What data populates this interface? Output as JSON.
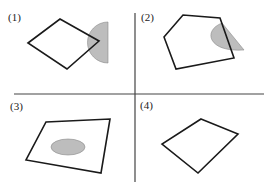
{
  "figure": {
    "colors": {
      "outline": "#1a1a1a",
      "shaded_region": "#bdbdbd",
      "divider": "#444444",
      "background": "#ffffff"
    },
    "dividers": {
      "horizontal": {
        "x1": 14,
        "y": 94,
        "x2": 264
      },
      "vertical": {
        "x": 135,
        "y1": 13,
        "y2": 182
      }
    },
    "panels": [
      {
        "id": 1,
        "label": "(1)",
        "outline": "rhombus",
        "shaded": "half-disk overlapping right vertex"
      },
      {
        "id": 2,
        "label": "(2)",
        "outline": "pentagon",
        "shaded": "half-disk overlapping right edge"
      },
      {
        "id": 3,
        "label": "(3)",
        "outline": "quadrilateral",
        "shaded": "ellipse inside"
      },
      {
        "id": 4,
        "label": "(4)",
        "outline": "quadrilateral",
        "shaded": "none"
      }
    ]
  }
}
